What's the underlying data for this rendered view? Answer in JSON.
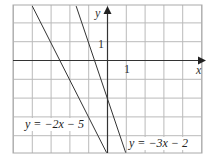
{
  "chart_data": {
    "type": "line",
    "title": "",
    "xlabel": "x",
    "ylabel": "y",
    "xlim": [
      -5,
      5
    ],
    "ylim": [
      -5,
      3
    ],
    "grid": true,
    "tick_labels": {
      "x": [
        "1"
      ],
      "y": [
        "1"
      ]
    },
    "series": [
      {
        "name": "y = −2x − 5",
        "slope": -2,
        "intercept": -5
      },
      {
        "name": "y = −3x − 2",
        "slope": -3,
        "intercept": -2
      }
    ]
  },
  "labels": {
    "line1": "y = −2x − 5",
    "line2": "y = −3x − 2",
    "x_axis": "x",
    "y_axis": "y",
    "x_tick": "1",
    "y_tick": "1"
  }
}
